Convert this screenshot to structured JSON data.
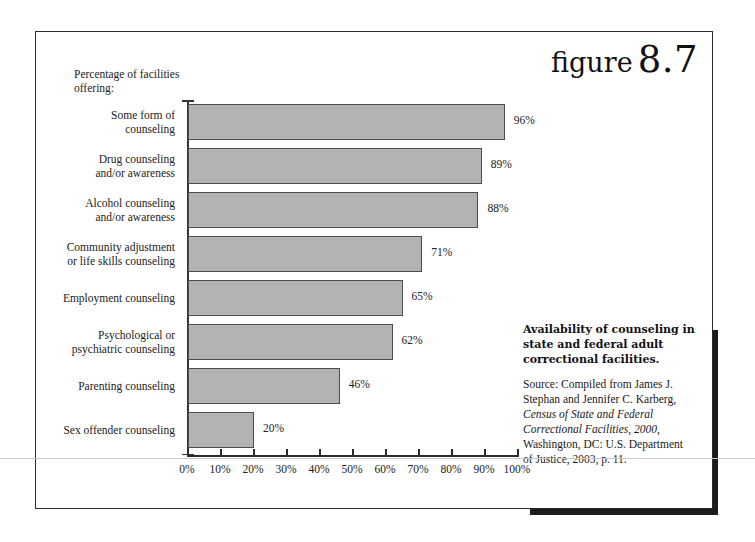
{
  "figure": {
    "word": "figure",
    "number": "8.7"
  },
  "axis_title": "Percentage of facilities\noffering:",
  "caption": {
    "title": "Availability of counseling in state and federal adult correctional facilities.",
    "source_prefix": "Source: Compiled from James J. Stephan and Jennifer C. Karberg, ",
    "source_italic": "Census of State and Federal Correctional Facilities, 2000",
    "source_suffix": ", Washington, DC: U.S. Department of Justice, 2003, p. 11."
  },
  "chart_data": {
    "type": "bar",
    "orientation": "horizontal",
    "title": "Availability of counseling in state and federal adult correctional facilities.",
    "subtitle": "Percentage of facilities offering:",
    "xlabel": "",
    "ylabel": "",
    "xlim": [
      0,
      100
    ],
    "grid": false,
    "legend": false,
    "bar_color": "#b3b3b3",
    "bar_border_color": "#4d4d4d",
    "categories": [
      "Some form of counseling",
      "Drug counseling and/or awareness",
      "Alcohol counseling and/or awareness",
      "Community adjustment or life skills counseling",
      "Employment counseling",
      "Psychological or psychiatric counseling",
      "Parenting counseling",
      "Sex offender counseling"
    ],
    "category_lines": [
      [
        "Some form of",
        "counseling"
      ],
      [
        "Drug counseling",
        "and/or awareness"
      ],
      [
        "Alcohol counseling",
        "and/or awareness"
      ],
      [
        "Community adjustment",
        "or life skills counseling"
      ],
      [
        "Employment counseling"
      ],
      [
        "Psychological or",
        "psychiatric counseling"
      ],
      [
        "Parenting counseling"
      ],
      [
        "Sex offender counseling"
      ]
    ],
    "values": [
      96,
      89,
      88,
      71,
      65,
      62,
      46,
      20
    ],
    "value_labels": [
      "96%",
      "89%",
      "88%",
      "71%",
      "65%",
      "62%",
      "46%",
      "20%"
    ],
    "xticks": [
      0,
      10,
      20,
      30,
      40,
      50,
      60,
      70,
      80,
      90,
      100
    ],
    "xtick_labels": [
      "0%",
      "10%",
      "20%",
      "30%",
      "40%",
      "50%",
      "60%",
      "70%",
      "80%",
      "90%",
      "100%"
    ]
  }
}
